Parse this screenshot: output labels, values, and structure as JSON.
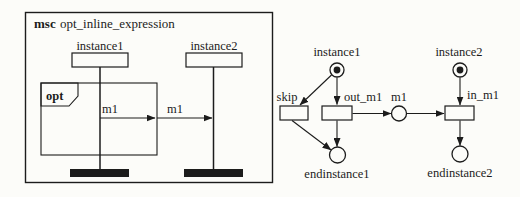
{
  "colors": {
    "ink": "#1c1c1c",
    "paper": "#fcfcf9"
  },
  "msc": {
    "keyword": "msc",
    "title": "opt_inline_expression",
    "instances": [
      {
        "name": "instance1"
      },
      {
        "name": "instance2"
      }
    ],
    "inline_expression": {
      "operator": "opt"
    },
    "messages": [
      {
        "label": "m1",
        "from": "instance1",
        "to": "inline-expression-boundary"
      },
      {
        "label": "m1",
        "from": "inline-expression-boundary",
        "to": "instance2"
      }
    ]
  },
  "petri_net": {
    "places": [
      {
        "name": "instance1",
        "marked": true
      },
      {
        "name": "instance2",
        "marked": true
      },
      {
        "name": "m1",
        "marked": false
      },
      {
        "name": "endinstance1",
        "marked": false
      },
      {
        "name": "endinstance2",
        "marked": false
      }
    ],
    "transitions": [
      {
        "name": "skip"
      },
      {
        "name": "out_m1"
      },
      {
        "name": "in_m1"
      }
    ],
    "arcs": [
      "instance1 -> skip",
      "instance1 -> out_m1",
      "skip -> endinstance1",
      "out_m1 -> endinstance1",
      "out_m1 -> m1",
      "m1 -> in_m1",
      "instance2 -> in_m1",
      "in_m1 -> endinstance2"
    ]
  }
}
